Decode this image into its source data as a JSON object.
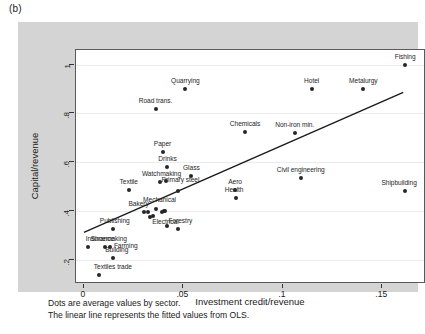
{
  "figure": {
    "panel_label": "(b)",
    "caption_lines": [
      "Dots are average values by sector.",
      "The linear line represents the fitted values from OLS."
    ]
  },
  "chart_data": {
    "type": "scatter",
    "title": "",
    "xlabel": "Investment credit/revenue",
    "ylabel": "Capital/revenue",
    "xlim": [
      -0.004,
      0.172
    ],
    "ylim": [
      0.1,
      1.06
    ],
    "xticks": [
      0,
      0.05,
      0.1,
      0.15
    ],
    "xticklabels": [
      "0",
      ".05",
      ".1",
      ".15"
    ],
    "yticks": [
      0.2,
      0.4,
      0.6,
      0.8,
      1
    ],
    "yticklabels": [
      ".2",
      ".4",
      ".6",
      ".8",
      "1"
    ],
    "grid": true,
    "legend": false,
    "marker_color": "#262626",
    "line_color": "#1a1a1a",
    "points": [
      {
        "label": "Fishing",
        "x": 0.1615,
        "y": 0.998,
        "lx": 0,
        "ly": -8
      },
      {
        "label": "Hotel",
        "x": 0.1145,
        "y": 0.9,
        "lx": 0,
        "ly": -8
      },
      {
        "label": "Metalurgy",
        "x": 0.1405,
        "y": 0.9,
        "lx": 0,
        "ly": -8
      },
      {
        "label": "Quarrying",
        "x": 0.051,
        "y": 0.9,
        "lx": 0,
        "ly": -8
      },
      {
        "label": "Road trans.",
        "x": 0.036,
        "y": 0.82,
        "lx": 0,
        "ly": -8
      },
      {
        "label": "Chemicals",
        "x": 0.081,
        "y": 0.723,
        "lx": 0,
        "ly": -8
      },
      {
        "label": "Non-iron min.",
        "x": 0.106,
        "y": 0.718,
        "lx": 0,
        "ly": -8
      },
      {
        "label": "Paper",
        "x": 0.0395,
        "y": 0.642,
        "lx": 0,
        "ly": -8
      },
      {
        "label": "Drinks",
        "x": 0.042,
        "y": 0.58,
        "lx": 0,
        "ly": -8
      },
      {
        "label": "Glass",
        "x": 0.054,
        "y": 0.545,
        "lx": 0,
        "ly": -8
      },
      {
        "label": "Civil engineering",
        "x": 0.109,
        "y": 0.533,
        "lx": 0,
        "ly": -8
      },
      {
        "label": "Watchmaking",
        "x": 0.038,
        "y": 0.52,
        "lx": 2,
        "ly": -8
      },
      {
        "label": "Primary steel",
        "x": 0.0415,
        "y": 0.521,
        "lx": 14,
        "ly": -1
      },
      {
        "label": "Textile",
        "x": 0.0225,
        "y": 0.487,
        "lx": 0,
        "ly": -8
      },
      {
        "label": "Aero",
        "x": 0.076,
        "y": 0.484,
        "lx": 0,
        "ly": -8
      },
      {
        "label": "Shipbuilding",
        "x": 0.1615,
        "y": 0.48,
        "lx": -6,
        "ly": -8
      },
      {
        "label": "Primary steel 2",
        "x": 0.0475,
        "y": 0.481,
        "lx": -999,
        "ly": 0
      },
      {
        "label": "Health",
        "x": 0.0765,
        "y": 0.452,
        "lx": -2,
        "ly": -8
      },
      {
        "label": "Mechanical",
        "x": 0.036,
        "y": 0.406,
        "lx": 4,
        "ly": -9
      },
      {
        "label": "Bakery",
        "x": 0.03,
        "y": 0.396,
        "lx": -5,
        "ly": -8
      },
      {
        "label": "Publishing",
        "x": 0.0145,
        "y": 0.326,
        "lx": 2,
        "ly": -8
      },
      {
        "label": "Electrical",
        "x": 0.041,
        "y": 0.398,
        "lx": 0,
        "ly": 11
      },
      {
        "label": "Forestry",
        "x": 0.0475,
        "y": 0.325,
        "lx": 2,
        "ly": -8
      },
      {
        "label": "Electrical dot",
        "x": 0.04,
        "y": 0.4,
        "lx": -999,
        "ly": 0
      },
      {
        "label": "Shoe dot",
        "x": 0.033,
        "y": 0.375,
        "lx": -999,
        "ly": 0
      },
      {
        "label": "Chem dot",
        "x": 0.0345,
        "y": 0.38,
        "lx": -999,
        "ly": 0
      },
      {
        "label": "Machine dot",
        "x": 0.039,
        "y": 0.394,
        "lx": -999,
        "ly": 0
      },
      {
        "label": "Print dot",
        "x": 0.032,
        "y": 0.394,
        "lx": -999,
        "ly": 0
      },
      {
        "label": "Forestry dot",
        "x": 0.042,
        "y": 0.337,
        "lx": -999,
        "ly": 0
      },
      {
        "label": "Insurance",
        "x": 0.002,
        "y": 0.25,
        "lx": 12,
        "ly": -8
      },
      {
        "label": "Shoemaking",
        "x": 0.0105,
        "y": 0.25,
        "lx": 4,
        "ly": -8
      },
      {
        "label": "Farming",
        "x": 0.013,
        "y": 0.25,
        "lx": 16,
        "ly": -1
      },
      {
        "label": "Building",
        "x": 0.0145,
        "y": 0.206,
        "lx": 4,
        "ly": -8
      },
      {
        "label": "Textiles trade",
        "x": 0.0075,
        "y": 0.137,
        "lx": 14,
        "ly": -8
      }
    ],
    "fit_line": {
      "x_start": 0.0,
      "y_start": 0.305,
      "x_end": 0.1615,
      "y_end": 0.885,
      "description": "OLS fitted line"
    }
  }
}
